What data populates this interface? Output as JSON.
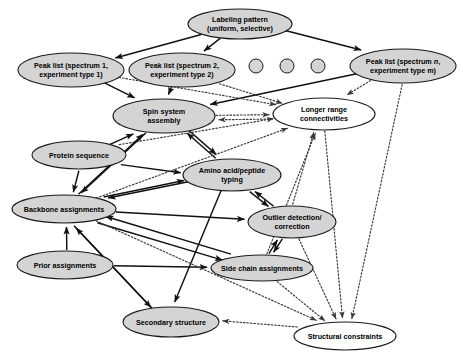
{
  "diagram": {
    "type": "directed-graph",
    "width": 463,
    "height": 358,
    "colors": {
      "node_fill": "#d4d4d4",
      "node_fill_white": "#ffffff",
      "node_stroke": "#1a1a1a",
      "edge_solid": "#111111",
      "edge_dotted": "#3a3a3a",
      "background": "#ffffff"
    },
    "nodes": [
      {
        "id": "labeling",
        "label_line1": "Labeling pattern",
        "label_line2": "(uniform, selective)",
        "cx": 240,
        "cy": 24,
        "rx": 52,
        "ry": 15,
        "fill": "filled"
      },
      {
        "id": "peak1",
        "label_line1": "Peak list (spectrum 1,",
        "label_line2": "experiment type 1)",
        "cx": 71,
        "cy": 70,
        "rx": 53,
        "ry": 17,
        "fill": "filled"
      },
      {
        "id": "peak2",
        "label_line1": "Peak list (spectrum 2,",
        "label_line2": "experiment type 2)",
        "cx": 182,
        "cy": 70,
        "rx": 53,
        "ry": 17,
        "fill": "filled"
      },
      {
        "id": "peakn",
        "label_line1": "Peak list (spectrum n,",
        "label_line2": "experiment type m)",
        "label_italic_1": "n",
        "label_italic_2": "m",
        "cx": 403,
        "cy": 66,
        "rx": 53,
        "ry": 17,
        "fill": "filled"
      },
      {
        "id": "spin",
        "label_line1": "Spin system",
        "label_line2": "assembly",
        "cx": 164,
        "cy": 116,
        "rx": 51,
        "ry": 17,
        "fill": "filled"
      },
      {
        "id": "longer",
        "label_line1": "Longer range",
        "label_line2": "connectivities",
        "cx": 324,
        "cy": 114,
        "rx": 51,
        "ry": 16,
        "fill": "white"
      },
      {
        "id": "protseq",
        "label_line1": "Protein sequence",
        "label_line2": "",
        "cx": 79,
        "cy": 155,
        "rx": 47,
        "ry": 14,
        "fill": "filled"
      },
      {
        "id": "aatype",
        "label_line1": "Amino acid/peptide",
        "label_line2": "typing",
        "cx": 232,
        "cy": 175,
        "rx": 49,
        "ry": 16,
        "fill": "filled"
      },
      {
        "id": "backbone",
        "label_line1": "Backbone assignments",
        "label_line2": "",
        "cx": 64,
        "cy": 209,
        "rx": 52,
        "ry": 14,
        "fill": "filled"
      },
      {
        "id": "outlier",
        "label_line1": "Outlier detection/",
        "label_line2": "correction",
        "cx": 292,
        "cy": 222,
        "rx": 44,
        "ry": 16,
        "fill": "filled"
      },
      {
        "id": "prior",
        "label_line1": "Prior assignments",
        "label_line2": "",
        "cx": 65,
        "cy": 265,
        "rx": 48,
        "ry": 14,
        "fill": "filled"
      },
      {
        "id": "sidechain",
        "label_line1": "Side chain assignments",
        "label_line2": "",
        "cx": 262,
        "cy": 268,
        "rx": 51,
        "ry": 13,
        "fill": "filled"
      },
      {
        "id": "secondary",
        "label_line1": "Secondary structure",
        "label_line2": "",
        "cx": 171,
        "cy": 322,
        "rx": 48,
        "ry": 15,
        "fill": "filled"
      },
      {
        "id": "structural",
        "label_line1": "Structural constraints",
        "label_line2": "",
        "cx": 345,
        "cy": 336,
        "rx": 51,
        "ry": 14,
        "fill": "white"
      }
    ],
    "ellipsis_dots": [
      {
        "cx": 256,
        "cy": 66,
        "r": 7
      },
      {
        "cx": 287,
        "cy": 66,
        "r": 7
      },
      {
        "cx": 318,
        "cy": 66,
        "r": 7
      }
    ],
    "edges": [
      {
        "from": "labeling",
        "to": "peak1",
        "style": "solid"
      },
      {
        "from": "labeling",
        "to": "peak2",
        "style": "solid"
      },
      {
        "from": "labeling",
        "to": "peakn",
        "style": "solid"
      },
      {
        "from": "peak1",
        "to": "spin",
        "style": "solid"
      },
      {
        "from": "peak2",
        "to": "spin",
        "style": "solid"
      },
      {
        "from": "peakn",
        "to": "spin",
        "style": "solid"
      },
      {
        "from": "peakn",
        "to": "longer",
        "style": "dotted"
      },
      {
        "from": "peak1",
        "to": "longer",
        "style": "dotted"
      },
      {
        "from": "peak2",
        "to": "longer",
        "style": "dotted"
      },
      {
        "from": "peakn",
        "to": "structural",
        "style": "dotted"
      },
      {
        "from": "spin",
        "to": "longer",
        "style": "dotted"
      },
      {
        "from": "longer",
        "to": "spin",
        "style": "dotted"
      },
      {
        "from": "spin",
        "to": "aatype",
        "style": "solid"
      },
      {
        "from": "aatype",
        "to": "spin",
        "style": "solid"
      },
      {
        "from": "protseq",
        "to": "spin",
        "style": "solid"
      },
      {
        "from": "protseq",
        "to": "backbone",
        "style": "solid"
      },
      {
        "from": "protseq",
        "to": "aatype",
        "style": "solid"
      },
      {
        "from": "protseq",
        "to": "longer",
        "style": "dotted"
      },
      {
        "from": "spin",
        "to": "backbone",
        "style": "solid"
      },
      {
        "from": "backbone",
        "to": "spin",
        "style": "solid"
      },
      {
        "from": "aatype",
        "to": "backbone",
        "style": "solid"
      },
      {
        "from": "backbone",
        "to": "aatype",
        "style": "solid"
      },
      {
        "from": "aatype",
        "to": "outlier",
        "style": "solid"
      },
      {
        "from": "outlier",
        "to": "aatype",
        "style": "solid"
      },
      {
        "from": "outlier",
        "to": "sidechain",
        "style": "solid"
      },
      {
        "from": "sidechain",
        "to": "outlier",
        "style": "solid"
      },
      {
        "from": "backbone",
        "to": "sidechain",
        "style": "solid"
      },
      {
        "from": "sidechain",
        "to": "backbone",
        "style": "solid"
      },
      {
        "from": "prior",
        "to": "backbone",
        "style": "solid"
      },
      {
        "from": "prior",
        "to": "sidechain",
        "style": "solid"
      },
      {
        "from": "backbone",
        "to": "secondary",
        "style": "solid"
      },
      {
        "from": "secondary",
        "to": "backbone",
        "style": "solid"
      },
      {
        "from": "aatype",
        "to": "secondary",
        "style": "solid"
      },
      {
        "from": "backbone",
        "to": "outlier",
        "style": "solid"
      },
      {
        "from": "backbone",
        "to": "longer",
        "style": "dotted"
      },
      {
        "from": "sidechain",
        "to": "longer",
        "style": "dotted"
      },
      {
        "from": "sidechain",
        "to": "structural",
        "style": "dotted"
      },
      {
        "from": "backbone",
        "to": "structural",
        "style": "dotted"
      },
      {
        "from": "outlier",
        "to": "structural",
        "style": "dotted"
      },
      {
        "from": "longer",
        "to": "structural",
        "style": "dotted"
      },
      {
        "from": "structural",
        "to": "secondary",
        "style": "dotted"
      },
      {
        "from": "outlier",
        "to": "longer",
        "style": "dotted"
      }
    ]
  }
}
